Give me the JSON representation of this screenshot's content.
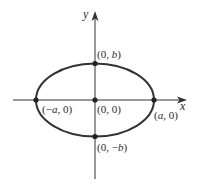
{
  "diagram": {
    "type": "ellipse-on-axes",
    "colors": {
      "stroke": "#333333",
      "background": "#ffffff"
    },
    "axes": {
      "x_label": "x",
      "y_label": "y"
    },
    "points": [
      {
        "id": "top",
        "label_pre": "(0, ",
        "label_var": "b",
        "label_post": ")"
      },
      {
        "id": "origin",
        "label": "(0, 0)"
      },
      {
        "id": "left",
        "label_pre": "(−",
        "label_var": "a",
        "label_post": ", 0)"
      },
      {
        "id": "right",
        "label_pre": "(",
        "label_var": "a",
        "label_post": ", 0)"
      },
      {
        "id": "bottom",
        "label_pre": "(0, −",
        "label_var": "b",
        "label_post": ")"
      }
    ]
  }
}
